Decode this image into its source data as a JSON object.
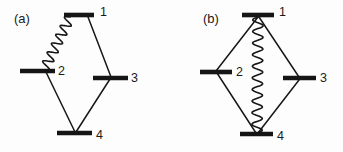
{
  "figure": {
    "background_color": "#fdfdfd",
    "ink_color": "#171717",
    "width": 343,
    "height": 152
  },
  "panels": [
    {
      "id": "panel-a",
      "label": "(a)",
      "label_x": 14,
      "label_y": 20,
      "levels": [
        {
          "id": "level-1",
          "label": "1",
          "x1": 64,
          "y": 15,
          "x2": 94,
          "label_x": 100,
          "label_y": 13
        },
        {
          "id": "level-2",
          "label": "2",
          "x1": 20,
          "y": 71,
          "x2": 55,
          "label_x": 58,
          "label_y": 72
        },
        {
          "id": "level-3",
          "label": "3",
          "x1": 93,
          "y": 78,
          "x2": 128,
          "label_x": 131,
          "label_y": 79
        },
        {
          "id": "level-4",
          "label": "4",
          "x1": 57,
          "y": 133,
          "x2": 92,
          "label_x": 96,
          "label_y": 136
        }
      ],
      "straight_couplings": [
        {
          "id": "coupling-1-3",
          "from": "1",
          "to": "3",
          "x1": 88,
          "y1": 17,
          "x2": 111,
          "y2": 77
        },
        {
          "id": "coupling-2-4",
          "from": "2",
          "to": "4",
          "x1": 45,
          "y1": 70,
          "x2": 75,
          "y2": 132
        },
        {
          "id": "coupling-3-4",
          "from": "3",
          "to": "4",
          "x1": 110,
          "y1": 79,
          "x2": 76,
          "y2": 132
        }
      ],
      "wavy_couplings": [
        {
          "id": "wavy-1-2",
          "from": "1",
          "to": "2",
          "x1": 70,
          "y1": 17,
          "x2": 44,
          "y2": 70,
          "amplitude": 5.0,
          "cycles": 6
        }
      ]
    },
    {
      "id": "panel-b",
      "label": "(b)",
      "label_x": 203,
      "label_y": 20,
      "levels": [
        {
          "id": "level-1",
          "label": "1",
          "x1": 242,
          "y": 15,
          "x2": 274,
          "label_x": 279,
          "label_y": 13
        },
        {
          "id": "level-2",
          "label": "2",
          "x1": 200,
          "y": 72,
          "x2": 232,
          "label_x": 236,
          "label_y": 73
        },
        {
          "id": "level-3",
          "label": "3",
          "x1": 283,
          "y": 78,
          "x2": 316,
          "label_x": 320,
          "label_y": 79
        },
        {
          "id": "level-4",
          "label": "4",
          "x1": 240,
          "y": 134,
          "x2": 273,
          "label_x": 277,
          "label_y": 137
        }
      ],
      "straight_couplings": [
        {
          "id": "coupling-1-2",
          "from": "1",
          "to": "2",
          "x1": 258,
          "y1": 17,
          "x2": 216,
          "y2": 71
        },
        {
          "id": "coupling-1-3",
          "from": "1",
          "to": "3",
          "x1": 259,
          "y1": 17,
          "x2": 299,
          "y2": 77
        },
        {
          "id": "coupling-2-4",
          "from": "2",
          "to": "4",
          "x1": 217,
          "y1": 73,
          "x2": 256,
          "y2": 133
        },
        {
          "id": "coupling-3-4",
          "from": "3",
          "to": "4",
          "x1": 299,
          "y1": 80,
          "x2": 258,
          "y2": 133
        }
      ],
      "wavy_couplings": [
        {
          "id": "wavy-1-4",
          "from": "1",
          "to": "4",
          "x1": 258,
          "y1": 17,
          "x2": 257,
          "y2": 133,
          "amplitude": 5.2,
          "cycles": 10
        }
      ]
    }
  ]
}
